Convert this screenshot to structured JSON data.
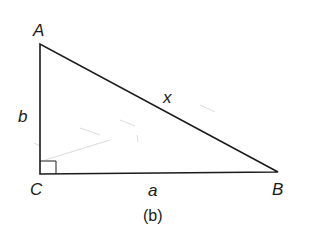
{
  "figure": {
    "caption": "(b)",
    "vertices": {
      "A": {
        "label": "A"
      },
      "B": {
        "label": "B"
      },
      "C": {
        "label": "C"
      }
    },
    "sides": {
      "AC": {
        "label": "b"
      },
      "CB": {
        "label": "a"
      },
      "AB": {
        "label": "x"
      }
    },
    "right_angle_at": "C",
    "colors": {
      "line": "#1a1a1a",
      "faint": "#d8d8d8"
    }
  }
}
